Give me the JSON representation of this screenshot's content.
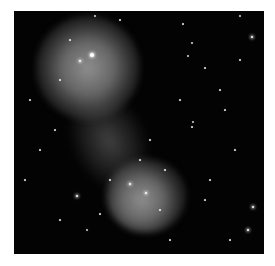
{
  "image": {
    "description": "Astronomical image of two diffuse glowing galaxies/clusters connected by a faint bridge against a black star field",
    "background_color": "#030303",
    "glow_color": "#9a9a9a",
    "objects": [
      {
        "name": "upper-galaxy",
        "center": [
          80,
          55
        ],
        "radius": 52
      },
      {
        "name": "lower-galaxy",
        "center": [
          132,
          185
        ],
        "radius": 40
      }
    ],
    "stars": [
      [
        92,
        55,
        3
      ],
      [
        80,
        61,
        2
      ],
      [
        146,
        193,
        2
      ],
      [
        130,
        184,
        2
      ],
      [
        252,
        37,
        2
      ],
      [
        253,
        207,
        2
      ],
      [
        248,
        230,
        2
      ],
      [
        77,
        196,
        2
      ],
      [
        192,
        43,
        1.5
      ],
      [
        188,
        56,
        1.5
      ],
      [
        240,
        16,
        1.5
      ],
      [
        205,
        68,
        1
      ],
      [
        240,
        60,
        1
      ],
      [
        193,
        122,
        1.5
      ],
      [
        192,
        127,
        1
      ],
      [
        87,
        230,
        1.5
      ],
      [
        160,
        210,
        1
      ],
      [
        183,
        24,
        1
      ],
      [
        220,
        90,
        1
      ],
      [
        235,
        150,
        1
      ],
      [
        30,
        100,
        1
      ],
      [
        40,
        150,
        1
      ],
      [
        100,
        214,
        1
      ],
      [
        170,
        240,
        1
      ],
      [
        60,
        220,
        1
      ],
      [
        210,
        180,
        1
      ],
      [
        150,
        140,
        1
      ],
      [
        225,
        110,
        1
      ],
      [
        120,
        20,
        1
      ],
      [
        55,
        130,
        1
      ],
      [
        25,
        180,
        1
      ],
      [
        205,
        200,
        1
      ],
      [
        95,
        16,
        1.5
      ],
      [
        230,
        240,
        1
      ],
      [
        180,
        100,
        1
      ],
      [
        60,
        80,
        1
      ],
      [
        70,
        40,
        1
      ],
      [
        110,
        180,
        1
      ],
      [
        140,
        160,
        1
      ],
      [
        165,
        170,
        1
      ]
    ]
  }
}
